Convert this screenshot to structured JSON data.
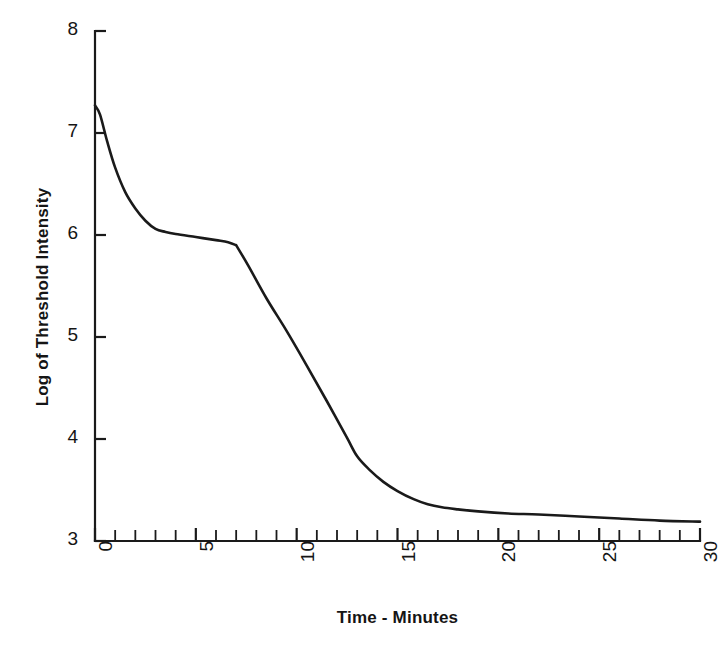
{
  "chart_data": {
    "type": "line",
    "title": "",
    "xlabel": "Time - Minutes",
    "ylabel": "Log of Threshold Intensity",
    "xlim": [
      0,
      30
    ],
    "ylim": [
      3,
      8
    ],
    "xticks": [
      0,
      5,
      10,
      15,
      20,
      25,
      30
    ],
    "xtick_labels": [
      "0",
      "5",
      "10",
      "15",
      "20",
      "25",
      "30"
    ],
    "xtick_label_rotation": -90,
    "minor_xtick_interval": 1,
    "yticks": [
      3,
      4,
      5,
      6,
      7,
      8
    ],
    "ytick_labels": [
      "3",
      "4",
      "5",
      "6",
      "7",
      "8"
    ],
    "grid": false,
    "legend": null,
    "legend_position": "none",
    "line_color": "#1a1a1a",
    "line_width": 2.6,
    "background_color": "#ffffff",
    "axis_color": "#1a1a1a",
    "series": [
      {
        "name": "Dark adaptation curve",
        "x": [
          0.0,
          0.25,
          0.6,
          1.0,
          1.5,
          2.0,
          2.5,
          3.0,
          3.5,
          4.0,
          5.0,
          6.0,
          6.6,
          7.0,
          7.6,
          8.5,
          9.5,
          10.5,
          11.5,
          12.5,
          13.0,
          13.6,
          14.3,
          15.0,
          15.8,
          16.5,
          17.2,
          18.0,
          19.0,
          20.5,
          22.0,
          24.0,
          26.0,
          28.0,
          30.0
        ],
        "y": [
          7.27,
          7.18,
          6.92,
          6.66,
          6.42,
          6.26,
          6.14,
          6.06,
          6.03,
          6.01,
          5.98,
          5.95,
          5.93,
          5.9,
          5.7,
          5.38,
          5.06,
          4.72,
          4.37,
          4.01,
          3.83,
          3.7,
          3.58,
          3.49,
          3.41,
          3.36,
          3.33,
          3.31,
          3.29,
          3.27,
          3.26,
          3.24,
          3.22,
          3.2,
          3.19
        ]
      }
    ],
    "annotations": [
      {
        "name": "rod-cone-break",
        "x": 7.0,
        "y": 5.9,
        "text": ""
      }
    ]
  }
}
